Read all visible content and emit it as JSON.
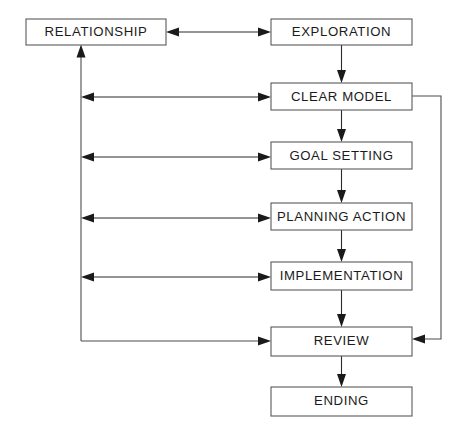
{
  "diagram": {
    "background_color": "#ffffff",
    "box_fill": "#ffffff",
    "box_stroke": "#59595b",
    "line_color": "#4d4d4f",
    "text_color": "#1b1b1b",
    "nodes": [
      {
        "id": "relationship",
        "label": "RELATIONSHIP",
        "x": 26,
        "y": 19,
        "w": 140,
        "h": 26
      },
      {
        "id": "exploration",
        "label": "EXPLORATION",
        "x": 271,
        "y": 19,
        "w": 141,
        "h": 26
      },
      {
        "id": "clear_model",
        "label": "CLEAR MODEL",
        "x": 271,
        "y": 83,
        "w": 141,
        "h": 27
      },
      {
        "id": "goal_setting",
        "label": "GOAL SETTING",
        "x": 271,
        "y": 142,
        "w": 141,
        "h": 27
      },
      {
        "id": "planning_action",
        "label": "PLANNING ACTION",
        "x": 271,
        "y": 203,
        "w": 141,
        "h": 27
      },
      {
        "id": "implementation",
        "label": "IMPLEMENTATION",
        "x": 271,
        "y": 262,
        "w": 141,
        "h": 28
      },
      {
        "id": "review",
        "label": "REVIEW",
        "x": 271,
        "y": 327,
        "w": 141,
        "h": 29
      },
      {
        "id": "ending",
        "label": "ENDING",
        "x": 271,
        "y": 387,
        "w": 141,
        "h": 29
      }
    ],
    "edges": [
      {
        "id": "relationship-exploration",
        "kind": "bidirectional-horizontal",
        "from": "relationship",
        "to": "exploration"
      },
      {
        "id": "exploration-clear-model",
        "kind": "vertical-down",
        "from": "exploration",
        "to": "clear_model"
      },
      {
        "id": "clear-model-goal-setting",
        "kind": "vertical-down",
        "from": "clear_model",
        "to": "goal_setting"
      },
      {
        "id": "goal-setting-planning",
        "kind": "vertical-down",
        "from": "goal_setting",
        "to": "planning_action"
      },
      {
        "id": "planning-implementation",
        "kind": "vertical-down",
        "from": "planning_action",
        "to": "implementation"
      },
      {
        "id": "implementation-review",
        "kind": "vertical-down",
        "from": "implementation",
        "to": "review"
      },
      {
        "id": "review-ending",
        "kind": "vertical-down",
        "from": "review",
        "to": "ending"
      },
      {
        "id": "clear-model-spine",
        "kind": "bidirectional-to-spine",
        "from": "clear_model",
        "to": "relationship"
      },
      {
        "id": "goal-setting-spine",
        "kind": "bidirectional-to-spine",
        "from": "goal_setting",
        "to": "relationship"
      },
      {
        "id": "planning-spine",
        "kind": "bidirectional-to-spine",
        "from": "planning_action",
        "to": "relationship"
      },
      {
        "id": "implementation-spine",
        "kind": "bidirectional-to-spine",
        "from": "implementation",
        "to": "relationship"
      },
      {
        "id": "spine-review",
        "kind": "spine-elbow-to-review",
        "from": "relationship",
        "to": "review"
      },
      {
        "id": "review-clear-model-loop",
        "kind": "right-feedback-loop",
        "from": "clear_model",
        "to": "review"
      }
    ]
  }
}
